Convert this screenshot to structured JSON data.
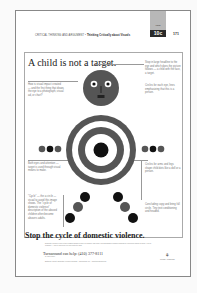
{
  "header": {
    "section": "CRITICAL THINKING AND ARGUMENT",
    "chapter_title": "Thinking Critically about Visuals",
    "tab_label": "10c",
    "tab_sublabel": "visual",
    "page_number": "171"
  },
  "ad": {
    "headline": "A child is not a target.",
    "notes": {
      "left_top": "How is visual impact created — and the first thing that draws the eye to a photograph, visual ad, or chart?",
      "left_mid": "Both eyes and attention — target is used through visual means to make.",
      "left_bottom": "\"Cycle\" — the a circle — visual to avoid this image shows. The \"cycle of domestic violence\" description of the abused children often become abusers adults.",
      "right_top": "Stop in large headline to the eye and which does the picture follows — a child with the face, a target.",
      "right_mid": "Circles for each eye, lines emphasizing that this is a person.",
      "right_lower": "Circles for arms and legs shape child dots like a doll or a person.",
      "right_bottom": "Concluding copy and bring full circle. Tiny text conditioning and headed."
    },
    "tagline": "Stop the cycle of domestic violence.",
    "fine_print": "Domestic violence is one of the leading causes of injury to children, and each year thousands of children witness or experience abuse at home. Help is available — call to learn how you can protect a child.",
    "helpline": "Turnaround can help: (410) 377-8111",
    "helpline_sub": "24-hour hotline",
    "footer_text": "Baltimore County Domestic Violence Program · Turnaround, Inc. · www.turnaround.org",
    "logo": "TURN AROUND"
  },
  "colors": {
    "dark": "#1a1a1a",
    "mid": "#555555",
    "tab_gray": "#b8b8b8"
  }
}
